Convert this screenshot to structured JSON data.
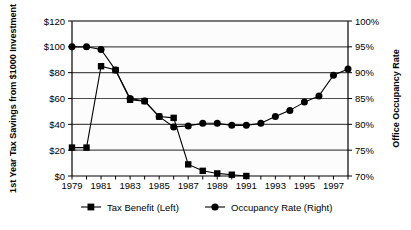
{
  "chart_data": {
    "type": "line",
    "title": "",
    "xlabel": "",
    "ylabel": "1st Year Tax Savings from $1000 Investment",
    "y2label": "Office Occupancy Rate",
    "grid": true,
    "legend_position": "bottom",
    "x": [
      1979,
      1980,
      1981,
      1982,
      1983,
      1984,
      1985,
      1986,
      1987,
      1988,
      1989,
      1990,
      1991,
      1992,
      1993,
      1994,
      1995,
      1996,
      1997,
      1998
    ],
    "xlim": [
      1979,
      1998
    ],
    "x_tick_labels": [
      "1979",
      "1981",
      "1983",
      "1985",
      "1987",
      "1989",
      "1991",
      "1993",
      "1995",
      "1997"
    ],
    "x_tick_values": [
      1979,
      1981,
      1983,
      1985,
      1987,
      1989,
      1991,
      1993,
      1995,
      1997
    ],
    "ylim": [
      0,
      120
    ],
    "y_tick_labels": [
      "$0",
      "$20",
      "$40",
      "$60",
      "$80",
      "$100",
      "$120"
    ],
    "y_tick_values": [
      0,
      20,
      40,
      60,
      80,
      100,
      120
    ],
    "y2lim": [
      70,
      100
    ],
    "y2_tick_labels": [
      "70%",
      "75%",
      "80%",
      "85%",
      "90%",
      "95%",
      "100%"
    ],
    "y2_tick_values": [
      70,
      75,
      80,
      85,
      90,
      95,
      100
    ],
    "series": [
      {
        "name": "Tax Benefit (Left)",
        "axis": "left",
        "marker": "square",
        "color": "#000000",
        "values": [
          22,
          22,
          85,
          82,
          59,
          58,
          46,
          45,
          9,
          4,
          2,
          1,
          0,
          null,
          null,
          null,
          null,
          null,
          null,
          null
        ]
      },
      {
        "name": "Occupancy Rate (Right)",
        "axis": "right",
        "marker": "circle",
        "color": "#000000",
        "values": [
          95,
          95,
          94.5,
          90.5,
          85,
          84.5,
          81.5,
          79.5,
          79.7,
          80.2,
          80.2,
          79.8,
          79.8,
          80.2,
          81.5,
          82.7,
          84.3,
          85.5,
          89.5,
          90.7
        ]
      }
    ]
  },
  "axes": {
    "left_title": "1st Year Tax Savings from $1000 Investment",
    "right_title": "Office Occupancy Rate"
  },
  "legend": {
    "items": [
      {
        "label": "Tax Benefit (Left)",
        "marker": "square"
      },
      {
        "label": "Occupancy Rate (Right)",
        "marker": "circle"
      }
    ]
  },
  "colors": {
    "series": "#000000",
    "grid": "#4d4d4d",
    "axis": "#000000",
    "plot_background": "#fcfcfc",
    "page_background": "#ffffff"
  }
}
